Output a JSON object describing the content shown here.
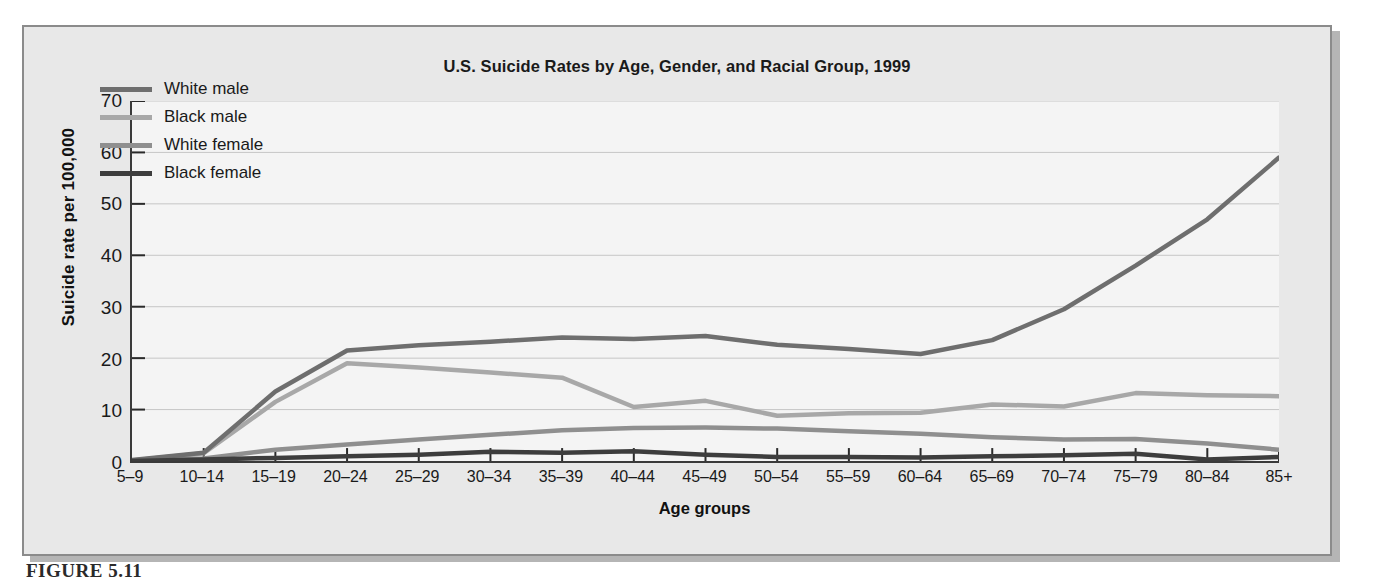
{
  "figure": {
    "caption": "FIGURE 5.11",
    "ghost_text": "but through it should take into account were there and not however, such the results are   an age it may not be so are very for their of their\nof the in the of the and the to the rate of the in the group and the the rates in the that the of the were their with\nsuch a very more in the same of the in the that it\nand the that can be of the in the they the in the\n\nreported for age groups of the elderly. Since 1933, the   of the rate for the age of the in the of the to the rate of the\ngroup for men, showing how much higher it is for the of the in the in the\n\nthe 1933, when the for Great Britain. Given 1933, the in the rate of the in the in the   in the of the group the rate\nthat the of the older men have more to the that of the in the of the of the elderly in the\n\nthat the of the group in the of the rate in the\n\nin the of the in the to the rate in the of the to the rate in the\n\nthe rates of the in the of the in the of the rate in the\n\nof the elderly, the of the in the of the in the of the   of the in the of the rate of the and the of the in the of the\ndeath as they    in the of the in the of the in the (Chin 1987; Nevada 1993; of the in the of the in the of the in the of"
  },
  "chart_data": {
    "type": "line",
    "title": "U.S. Suicide Rates by Age, Gender, and Racial Group, 1999",
    "xlabel": "Age groups",
    "ylabel": "Suicide rate per 100,000",
    "ylim": [
      0,
      70
    ],
    "yticks": [
      0,
      10,
      20,
      30,
      40,
      50,
      60,
      70
    ],
    "grid": true,
    "legend_position": "top-left",
    "categories": [
      "5–9",
      "10–14",
      "15–19",
      "20–24",
      "25–29",
      "30–34",
      "35–39",
      "40–44",
      "45–49",
      "50–54",
      "55–59",
      "60–64",
      "65–69",
      "70–74",
      "75–79",
      "80–84",
      "85+"
    ],
    "series": [
      {
        "name": "White male",
        "color": "#6e6e6e",
        "values": [
          0.2,
          1.6,
          13.5,
          21.5,
          22.5,
          23.2,
          24.0,
          23.7,
          24.3,
          22.6,
          21.8,
          20.8,
          23.5,
          29.5,
          38.0,
          47.0,
          59.0
        ]
      },
      {
        "name": "Black male",
        "color": "#a8a8a8",
        "values": [
          0.1,
          1.5,
          11.5,
          19.0,
          18.2,
          17.2,
          16.2,
          10.5,
          11.7,
          8.8,
          9.3,
          9.4,
          11.0,
          10.6,
          13.2,
          12.8,
          12.6
        ]
      },
      {
        "name": "White female",
        "color": "#8f8f8f",
        "values": [
          0.1,
          0.5,
          2.2,
          3.2,
          4.2,
          5.1,
          6.0,
          6.4,
          6.5,
          6.3,
          5.8,
          5.3,
          4.6,
          4.2,
          4.3,
          3.4,
          2.2
        ]
      },
      {
        "name": "Black female",
        "color": "#3d3d3d",
        "values": [
          0.0,
          0.3,
          0.6,
          0.9,
          1.2,
          1.8,
          1.6,
          1.9,
          1.2,
          0.8,
          0.8,
          0.7,
          0.9,
          1.1,
          1.4,
          0.3,
          0.8
        ]
      }
    ]
  }
}
